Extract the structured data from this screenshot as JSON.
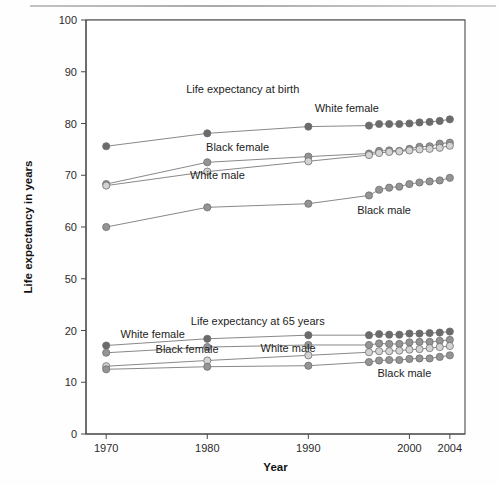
{
  "figure": {
    "y_axis_title": "Life expectancy in years",
    "x_axis_title": "Year",
    "panel_labels": {
      "top": "Life expectancy at birth",
      "bottom": "Life expectancy at 65 years"
    }
  },
  "chart_data": {
    "type": "line",
    "title": "",
    "xlabel": "Year",
    "ylabel": "Life expectancy in years",
    "xlim": [
      1968,
      2005.5
    ],
    "x_ticks": [
      1970,
      1980,
      1990,
      2000,
      2004
    ],
    "x_tick_labels": [
      "1970",
      "1980",
      "1990",
      "2000",
      "2004"
    ],
    "y_ticks": [
      0,
      10,
      20,
      50,
      60,
      70,
      80,
      90,
      100
    ],
    "y_tick_labels": [
      "0",
      "10",
      "20",
      "50",
      "60",
      "70",
      "80",
      "90",
      "100"
    ],
    "y_axis_note": "broken axis between 20 and 50",
    "gridlines": [
      10,
      20,
      50,
      60,
      70,
      80,
      90,
      100
    ],
    "grid": true,
    "legend_position": "inline-annotations",
    "annotations": [
      {
        "text": "Life expectancy at birth",
        "x": 1983.5,
        "y": 86.0,
        "anchor": "middle"
      },
      {
        "text": "White female",
        "x": 1993.8,
        "y": 82.2,
        "anchor": "middle"
      },
      {
        "text": "Black female",
        "x": 1983.0,
        "y": 74.6,
        "anchor": "middle"
      },
      {
        "text": "White male",
        "x": 1981.0,
        "y": 69.2,
        "anchor": "middle"
      },
      {
        "text": "Black male",
        "x": 1997.5,
        "y": 62.6,
        "anchor": "middle"
      },
      {
        "text": "Life expectancy at 65 years",
        "x": 1985.0,
        "y": 23.0,
        "anchor": "middle"
      },
      {
        "text": "White female",
        "x": 1974.6,
        "y": 18.6,
        "anchor": "middle"
      },
      {
        "text": "Black female",
        "x": 1978.0,
        "y": 15.6,
        "anchor": "middle"
      },
      {
        "text": "White male",
        "x": 1988.0,
        "y": 15.8,
        "anchor": "middle"
      },
      {
        "text": "Black male",
        "x": 1999.5,
        "y": 11.1,
        "anchor": "middle"
      }
    ],
    "panels": [
      {
        "name": "Life expectancy at birth",
        "series": [
          {
            "name": "White female",
            "marker": "filled-dark",
            "x": [
              1970,
              1980,
              1990,
              1996,
              1997,
              1998,
              1999,
              2000,
              2001,
              2002,
              2003,
              2004
            ],
            "values": [
              75.6,
              78.1,
              79.4,
              79.6,
              79.9,
              79.9,
              79.9,
              80.0,
              80.2,
              80.3,
              80.5,
              80.8
            ]
          },
          {
            "name": "Black female",
            "marker": "filled-mid",
            "x": [
              1970,
              1980,
              1990,
              1996,
              1997,
              1998,
              1999,
              2000,
              2001,
              2002,
              2003,
              2004
            ],
            "values": [
              68.3,
              72.5,
              73.6,
              74.2,
              74.7,
              74.8,
              74.7,
              75.1,
              75.5,
              75.6,
              76.1,
              76.3
            ]
          },
          {
            "name": "White male",
            "marker": "open-light",
            "x": [
              1970,
              1980,
              1990,
              1996,
              1997,
              1998,
              1999,
              2000,
              2001,
              2002,
              2003,
              2004
            ],
            "values": [
              68.0,
              70.7,
              72.7,
              73.9,
              74.3,
              74.5,
              74.6,
              74.8,
              75.0,
              75.1,
              75.3,
              75.7
            ]
          },
          {
            "name": "Black male",
            "marker": "filled-mid",
            "x": [
              1970,
              1980,
              1990,
              1996,
              1997,
              1998,
              1999,
              2000,
              2001,
              2002,
              2003,
              2004
            ],
            "values": [
              60.0,
              63.8,
              64.5,
              66.1,
              67.2,
              67.6,
              67.8,
              68.3,
              68.6,
              68.8,
              69.0,
              69.5
            ]
          }
        ]
      },
      {
        "name": "Life expectancy at 65 years",
        "series": [
          {
            "name": "White female",
            "marker": "filled-dark",
            "x": [
              1970,
              1980,
              1990,
              1996,
              1997,
              1998,
              1999,
              2000,
              2001,
              2002,
              2003,
              2004
            ],
            "values": [
              17.1,
              18.4,
              19.1,
              19.1,
              19.3,
              19.2,
              19.2,
              19.4,
              19.4,
              19.5,
              19.6,
              19.8
            ]
          },
          {
            "name": "Black female",
            "marker": "filled-mid",
            "x": [
              1970,
              1980,
              1990,
              1996,
              1997,
              1998,
              1999,
              2000,
              2001,
              2002,
              2003,
              2004
            ],
            "values": [
              15.7,
              16.8,
              17.2,
              17.2,
              17.5,
              17.4,
              17.4,
              17.7,
              17.8,
              17.8,
              18.0,
              18.2
            ]
          },
          {
            "name": "White male",
            "marker": "open-light",
            "x": [
              1970,
              1980,
              1990,
              1996,
              1997,
              1998,
              1999,
              2000,
              2001,
              2002,
              2003,
              2004
            ],
            "values": [
              13.1,
              14.2,
              15.2,
              15.8,
              16.0,
              16.0,
              16.1,
              16.3,
              16.4,
              16.6,
              16.8,
              17.0
            ]
          },
          {
            "name": "Black male",
            "marker": "filled-mid",
            "x": [
              1970,
              1980,
              1990,
              1996,
              1997,
              1998,
              1999,
              2000,
              2001,
              2002,
              2003,
              2004
            ],
            "values": [
              12.5,
              13.0,
              13.2,
              13.9,
              14.2,
              14.3,
              14.3,
              14.5,
              14.6,
              14.6,
              14.9,
              15.2
            ]
          }
        ]
      }
    ],
    "colors": {
      "filled-dark": "#6b6b6b",
      "filled-mid": "#949494",
      "open-light": "#d3d3d3",
      "line": "#7b7b7b",
      "axis": "#4a4a4a",
      "grid": "#6f6f6f",
      "text": "#1d1d1d"
    }
  }
}
